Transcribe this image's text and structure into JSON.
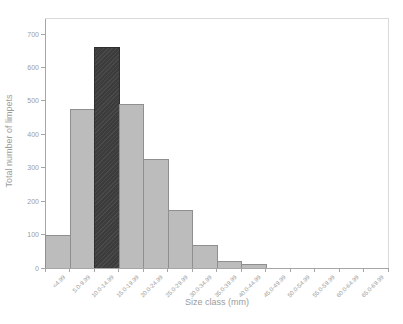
{
  "chart_data": {
    "type": "bar",
    "title": "",
    "xlabel": "Size class (mm)",
    "ylabel": "Total number of limpets",
    "categories": [
      "<4.99",
      "5.0-9.99",
      "10.0-14.99",
      "15.0-19.99",
      "20.0-24.99",
      "25.0-29.99",
      "30.0-34.99",
      "35.0-39.99",
      "40.0-44.99",
      "45.0-49.99",
      "50.0-54.99",
      "55.0-59.99",
      "60.0-64.99",
      "65.0-69.99"
    ],
    "values": [
      100,
      475,
      660,
      490,
      325,
      175,
      70,
      20,
      12,
      0,
      0,
      0,
      0,
      0
    ],
    "highlighted_index": 2,
    "highlighted_category": "10.0-14.99",
    "yticks": [
      0,
      100,
      200,
      300,
      400,
      500,
      600,
      700
    ],
    "ylim": [
      0,
      745
    ],
    "grid": false,
    "legend": "none",
    "colors": {
      "bar_fill": "#bcbcbc",
      "bar_border": "#8f8f8f",
      "highlight_fill": "#3c3c3c",
      "highlight_border": "#2f2f2f",
      "axis_line": "#a6a6a6",
      "frame_line": "#d9d9d9",
      "text": "#9c9c9c"
    }
  }
}
